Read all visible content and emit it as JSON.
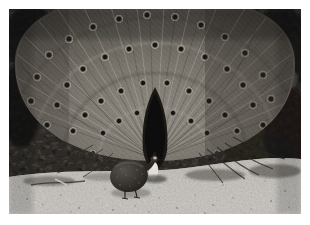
{
  "image": {
    "kind": "photograph",
    "medium": "black-and-white photographic print",
    "orientation": "landscape",
    "border": {
      "style": "white photo margin",
      "color": "#ffffff",
      "width_px": 9
    },
    "canvas": {
      "width_px": 310,
      "height_px": 225,
      "photo_width_px": 292,
      "photo_height_px": 205
    },
    "caption": "A peacock displays its fully fanned tail in front of dense foliage while a guinea fowl forages on the gravel path in front of it.",
    "alt_text": "Black and white photo of a peacock with tail feathers spread into a wide fan, eyespots visible, a guinea fowl standing on light gravel ground in the foreground."
  },
  "palette": {
    "paper_white": "#ffffff",
    "highlight": "#e8e6e1",
    "ground_light": "#cfcbc4",
    "ground_mid": "#a9a49c",
    "fan_light": "#9a958c",
    "fan_mid": "#6e6a63",
    "fan_dark": "#443f3a",
    "foliage_dark": "#3a3733",
    "deep_shadow": "#181715",
    "near_black": "#0d0c0b"
  },
  "subjects": [
    {
      "id": "peacock",
      "label": "Peacock",
      "description": "Male peacock facing the camera with tail feathers spread into a full circular fan.",
      "position": {
        "cx": 163,
        "cy": 150
      },
      "features": [
        "fanned train of feathers radiating outward",
        "numerous dark ocelli (eyespots) across the fan",
        "dark triangular body silhouette at fan centre",
        "white-marked head and neck below the fan centre"
      ]
    },
    {
      "id": "guinea-fowl",
      "label": "Guinea fowl",
      "description": "Dark rounded guinea fowl standing on the gravel in the lower left foreground.",
      "position": {
        "cx": 132,
        "cy": 172
      },
      "features": [
        "rounded speckled dark body",
        "small pale head turned to the right",
        "thin legs on gravel"
      ]
    }
  ],
  "scene_regions": [
    {
      "id": "foliage-backdrop",
      "label": "Dark foliage backdrop",
      "tone": "dark"
    },
    {
      "id": "light-blossom",
      "label": "Bright sunlit blossom cluster upper left",
      "tone": "highlight"
    },
    {
      "id": "tail-fan",
      "label": "Peacock tail fan",
      "tone": "mid"
    },
    {
      "id": "gravel-ground",
      "label": "Light gravel ground",
      "tone": "light"
    }
  ]
}
